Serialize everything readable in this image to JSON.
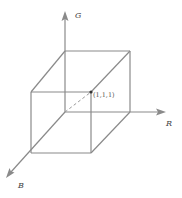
{
  "diagram": {
    "axes": [
      {
        "name": "G",
        "label": "G",
        "color": "#8a8a8a"
      },
      {
        "name": "R",
        "label": "R",
        "color": "#8a8a8a"
      },
      {
        "name": "B",
        "label": "B",
        "color": "#8a8a8a"
      }
    ],
    "point": {
      "label": "(1,1,1)"
    },
    "colors": {
      "edge": "#8a8a8a",
      "label": "#444444",
      "background": "#ffffff"
    }
  }
}
